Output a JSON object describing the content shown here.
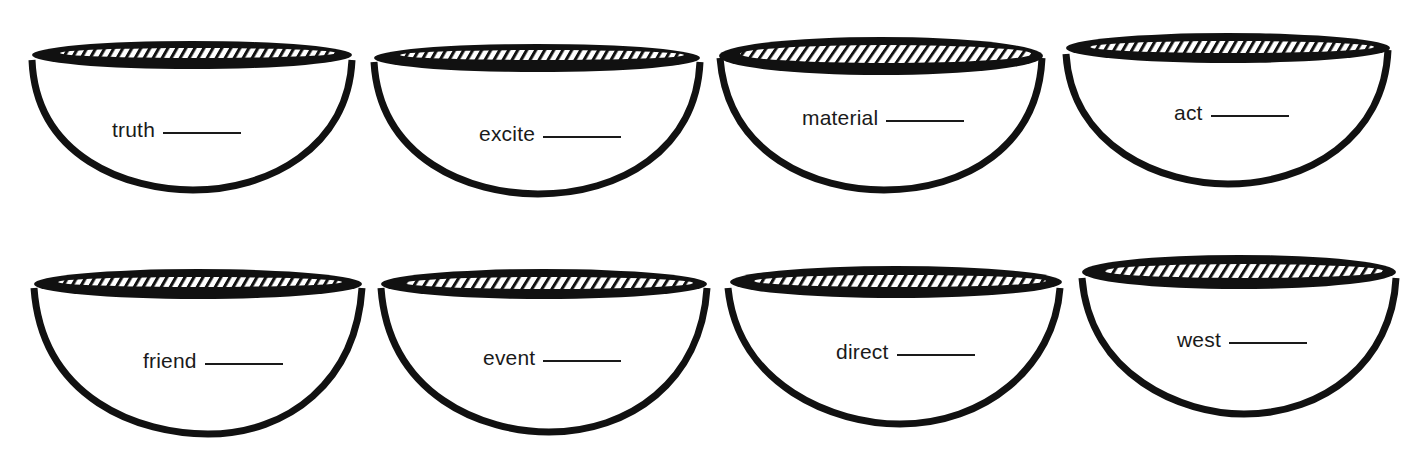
{
  "worksheet": {
    "colors": {
      "ink": "#111111",
      "paper": "#ffffff"
    },
    "bowls": [
      {
        "word": "truth",
        "blank": ""
      },
      {
        "word": "excite",
        "blank": ""
      },
      {
        "word": "material",
        "blank": ""
      },
      {
        "word": "act",
        "blank": ""
      },
      {
        "word": "friend",
        "blank": ""
      },
      {
        "word": "event",
        "blank": ""
      },
      {
        "word": "direct",
        "blank": ""
      },
      {
        "word": "west",
        "blank": ""
      }
    ]
  }
}
